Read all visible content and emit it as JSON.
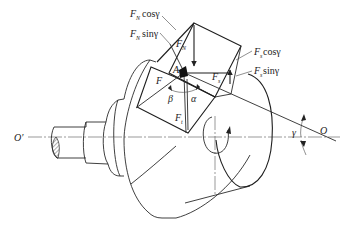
{
  "diagram": {
    "type": "force-decomposition-on-conical-tool",
    "labels": {
      "fn_cos": {
        "symbol": "F",
        "subscript": "N",
        "func": "cosγ"
      },
      "fn_sin": {
        "symbol": "F",
        "subscript": "N",
        "func": "sinγ"
      },
      "fs_cos": {
        "symbol": "F",
        "subscript": "s",
        "func": "cosγ"
      },
      "fs_sin": {
        "symbol": "F",
        "subscript": "s",
        "func": "sinγ"
      },
      "fn": {
        "symbol": "F",
        "subscript": "N"
      },
      "f": {
        "symbol": "F"
      },
      "fs": {
        "symbol": "F",
        "subscript": "s"
      },
      "ft": {
        "symbol": "F",
        "subscript": "t"
      },
      "point_a": "A",
      "alpha": "α",
      "beta": "β",
      "gamma": "γ",
      "origin_o": "O",
      "origin_o_prime": "O′"
    }
  }
}
